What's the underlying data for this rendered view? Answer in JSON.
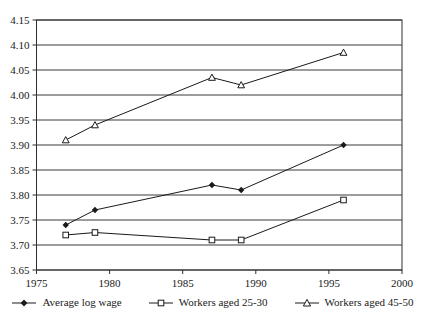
{
  "chart_data": {
    "type": "line",
    "title": "",
    "xlabel": "",
    "ylabel": "",
    "x": [
      1977,
      1979,
      1987,
      1989,
      1996
    ],
    "series": [
      {
        "name": "Average log wage",
        "marker": "diamond-filled",
        "values": [
          3.74,
          3.77,
          3.82,
          3.81,
          3.9
        ]
      },
      {
        "name": "Workers aged 25-30",
        "marker": "square-open",
        "values": [
          3.72,
          3.725,
          3.71,
          3.71,
          3.79
        ]
      },
      {
        "name": "Workers aged 45-50",
        "marker": "triangle-open",
        "values": [
          3.91,
          3.94,
          4.035,
          4.02,
          4.085
        ]
      }
    ],
    "xlim": [
      1975,
      2000
    ],
    "ylim": [
      3.65,
      4.15
    ],
    "x_ticks": [
      1975,
      1980,
      1985,
      1990,
      1995,
      2000
    ],
    "x_tick_labels": [
      "1975",
      "1980",
      "1985",
      "1990",
      "1995",
      "2000"
    ],
    "y_ticks": [
      3.65,
      3.7,
      3.75,
      3.8,
      3.85,
      3.9,
      3.95,
      4.0,
      4.05,
      4.1,
      4.15
    ],
    "y_tick_labels": [
      "3.65",
      "3.70",
      "3.75",
      "3.80",
      "3.85",
      "3.90",
      "3.95",
      "4.00",
      "4.05",
      "4.10",
      "4.15"
    ],
    "grid": "horizontal",
    "legend_position": "bottom"
  },
  "colors": {
    "background": "#ffffff",
    "axis_line": "#2e2e2e",
    "grid_line": "#3a3a3a",
    "series_line": "#1a1a1a",
    "marker_fill_open": "#ffffff",
    "text": "#1a1a1a"
  }
}
